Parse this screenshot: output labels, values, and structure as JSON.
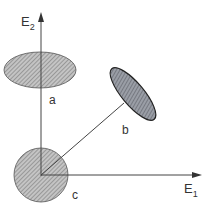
{
  "diagram": {
    "axes": {
      "x_label": "E",
      "x_subscript": "1",
      "y_label": "E",
      "y_subscript": "2",
      "origin": [
        41,
        175
      ]
    },
    "regions": [
      {
        "id": "a",
        "label": "a",
        "shape": "ellipse",
        "fill": "#b8b8b8"
      },
      {
        "id": "b",
        "label": "b",
        "shape": "tilted-ellipse",
        "fill": "#8a8e96"
      },
      {
        "id": "c",
        "label": "c",
        "shape": "circle",
        "fill": "#b8b8b8"
      }
    ],
    "colors": {
      "line": "#444444",
      "hatch": "#7a7a7a",
      "background": "#ffffff"
    }
  }
}
